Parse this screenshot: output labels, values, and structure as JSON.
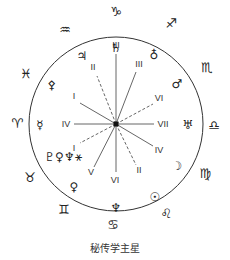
{
  "caption": "秘传学主星",
  "zodiac": [
    {
      "name": "capricorn",
      "glyph": "♑"
    },
    {
      "name": "sagittarius",
      "glyph": "♐"
    },
    {
      "name": "scorpio",
      "glyph": "♏"
    },
    {
      "name": "libra",
      "glyph": "♎"
    },
    {
      "name": "virgo",
      "glyph": "♍"
    },
    {
      "name": "leo",
      "glyph": "♌"
    },
    {
      "name": "cancer",
      "glyph": "♋"
    },
    {
      "name": "gemini",
      "glyph": "♊"
    },
    {
      "name": "taurus",
      "glyph": "♉"
    },
    {
      "name": "aries",
      "glyph": "♈"
    },
    {
      "name": "pisces",
      "glyph": "♓"
    },
    {
      "name": "aquarius",
      "glyph": "♒"
    }
  ],
  "planets": [
    {
      "name": "saturn",
      "glyph": "♄"
    },
    {
      "name": "earth",
      "glyph": "♁"
    },
    {
      "name": "mars",
      "glyph": "♂"
    },
    {
      "name": "uranus",
      "glyph": "♅"
    },
    {
      "name": "moon",
      "glyph": "☽"
    },
    {
      "name": "sun",
      "glyph": "☉"
    },
    {
      "name": "neptune",
      "glyph": "♆"
    },
    {
      "name": "venus",
      "glyph": "♀"
    },
    {
      "name": "vulcan-pluto-group",
      "glyph": "♇♀♆⚹"
    },
    {
      "name": "mercury",
      "glyph": "☿"
    },
    {
      "name": "vulcan",
      "glyph": "⚴"
    },
    {
      "name": "jupiter",
      "glyph": "♃"
    }
  ],
  "rays": [
    {
      "label": "III",
      "style": "solid"
    },
    {
      "label": "III",
      "style": "solid"
    },
    {
      "label": "VI",
      "style": "dashed"
    },
    {
      "label": "VII",
      "style": "solid"
    },
    {
      "label": "IV",
      "style": "solid"
    },
    {
      "label": "II",
      "style": "dashed"
    },
    {
      "label": "VI",
      "style": "solid"
    },
    {
      "label": "V",
      "style": "solid"
    },
    {
      "label": "I",
      "style": "dashed"
    },
    {
      "label": "IV",
      "style": "solid"
    },
    {
      "label": "I",
      "style": "solid"
    },
    {
      "label": "II",
      "style": "dashed"
    }
  ]
}
